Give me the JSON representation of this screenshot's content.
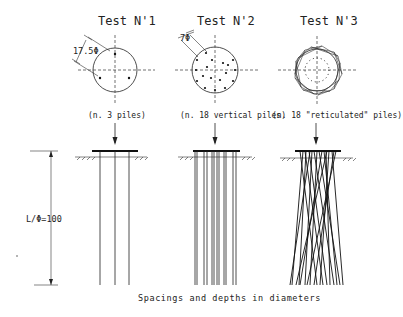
{
  "tests": [
    {
      "title": "Test N'1",
      "caption": "(n. 3 piles)",
      "dimension_label": "17.5Φ",
      "pile_count": 3,
      "pile_type": "vertical"
    },
    {
      "title": "Test N'2",
      "caption": "(n. 18 vertical piles)",
      "dimension_label": "7Φ",
      "pile_count": 18,
      "pile_type": "vertical"
    },
    {
      "title": "Test N'3",
      "caption": "(n. 18 \"reticulated\" piles)",
      "pile_count": 18,
      "pile_type": "reticulated"
    }
  ],
  "length_label": "L/Φ=100",
  "footnote": "Spacings and depths in diameters",
  "icons": {
    "load": "down-arrow-icon",
    "ground": "ground-hatch-icon"
  }
}
